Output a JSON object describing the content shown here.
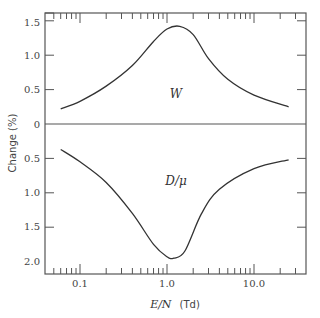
{
  "chart_data": {
    "type": "line",
    "title": "",
    "xlabel": "E/N (Td)",
    "xlabel_italic_part": "E/N",
    "xlabel_unit": "(Td)",
    "ylabel": "Change (%)",
    "xscale": "log",
    "xlim": [
      0.04,
      40
    ],
    "ylim_upper_panel": [
      0,
      1.6
    ],
    "ylim_lower_panel_inverted": [
      0,
      2.2
    ],
    "x_tick_labels": [
      "0.1",
      "1.0",
      "10.0"
    ],
    "y_tick_labels_upper": [
      "1.5",
      "1.0",
      "0.5",
      "0"
    ],
    "y_tick_labels_lower": [
      "0.5",
      "1.0",
      "1.5",
      "2.0"
    ],
    "grid": false,
    "legend": "inline labels",
    "series": [
      {
        "name": "W",
        "label": "W",
        "direction": "positive (above zero line)",
        "x": [
          0.06,
          0.1,
          0.2,
          0.4,
          0.7,
          1.0,
          1.4,
          2.0,
          3.0,
          5.0,
          10.0,
          25.0
        ],
        "values": [
          0.22,
          0.33,
          0.55,
          0.85,
          1.2,
          1.38,
          1.42,
          1.3,
          0.95,
          0.65,
          0.42,
          0.25
        ]
      },
      {
        "name": "D/mu",
        "label": "D/μ",
        "direction": "negative (below zero line, plotted downward)",
        "x": [
          0.06,
          0.1,
          0.2,
          0.4,
          0.7,
          1.0,
          1.2,
          1.6,
          2.5,
          4.0,
          10.0,
          25.0
        ],
        "values": [
          0.37,
          0.55,
          0.85,
          1.3,
          1.75,
          1.93,
          1.95,
          1.85,
          1.3,
          0.95,
          0.65,
          0.52
        ]
      }
    ],
    "annotations": [
      "W",
      "D/μ"
    ]
  }
}
